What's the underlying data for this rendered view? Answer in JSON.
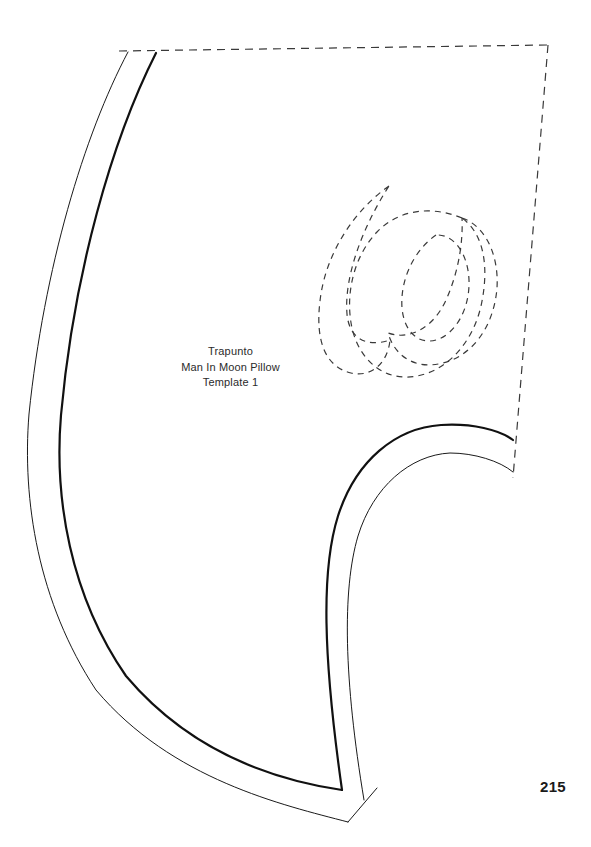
{
  "page": {
    "width": 591,
    "height": 847,
    "background_color": "#ffffff",
    "page_number": "215"
  },
  "caption": {
    "line1": "Trapunto",
    "line2": "Man In Moon Pillow",
    "line3": "Template 1"
  },
  "template": {
    "title": "Trapunto Man In Moon Pillow Template 1",
    "ink_color": "#111111",
    "thin_stroke_width": 1,
    "thick_stroke_width": 2.2,
    "dash_pattern": "7 5",
    "description": "Quarter-circle quilting template of a crescent moon face profile with dashed placement guides and dashed decorative swirl motifs",
    "parts": [
      {
        "name": "outer-left-arc-thin",
        "style": "solid-thin",
        "path": "M128,52 C84,135 44,268 29,414 C22,500 38,602 96,690 C172,780 283,805 348,822"
      },
      {
        "name": "inner-left-arc-thick",
        "style": "solid-thick",
        "path": "M156,53 C112,140 74,272 61,415 C54,498 70,595 126,676 C197,760 288,782 342,790"
      },
      {
        "name": "inner-right-arc-thick",
        "style": "solid-thick",
        "path": "M513,440 C500,430 472,423 441,425 C396,428 356,460 338,516 C321,570 323,656 342,790"
      },
      {
        "name": "inner-right-arc-thin",
        "style": "solid-thin",
        "path": "M513,472 C500,461 474,453 450,453 C410,455 373,487 358,536 C342,590 344,680 364,800"
      },
      {
        "name": "bottom-tip-edge",
        "style": "solid-thin",
        "path": "M348,822 L377,788"
      },
      {
        "name": "guide-top-dashed",
        "style": "dashed",
        "path": "M119,51 L548,45"
      },
      {
        "name": "guide-right-dashed",
        "style": "dashed",
        "path": "M548,45 L513,478"
      },
      {
        "name": "motif-crescent-left",
        "style": "dashed",
        "path": "M389,186 C352,212 325,256 320,301 C315,342 326,367 351,373 C372,378 388,362 390,340 C366,348 349,338 347,314 C344,277 362,228 389,186 Z"
      },
      {
        "name": "motif-spiral-outer",
        "style": "dashed",
        "path": "M462,218 C430,205 398,210 377,232 C353,257 345,296 352,328 C360,363 387,382 417,376 C449,370 473,341 481,306 C490,265 483,233 462,218 Z"
      },
      {
        "name": "motif-spiral-inner",
        "style": "dashed",
        "path": "M462,218 C486,226 499,256 497,288 C494,325 474,355 443,363 C416,370 395,357 388,333 C410,341 434,327 446,300 C460,269 463,238 462,218 Z"
      },
      {
        "name": "motif-spiral-eye",
        "style": "dashed",
        "path": "M436,235 C413,251 400,281 402,308 C404,331 418,345 436,340 C456,334 470,308 469,280 C468,254 454,234 436,235 Z"
      }
    ]
  }
}
